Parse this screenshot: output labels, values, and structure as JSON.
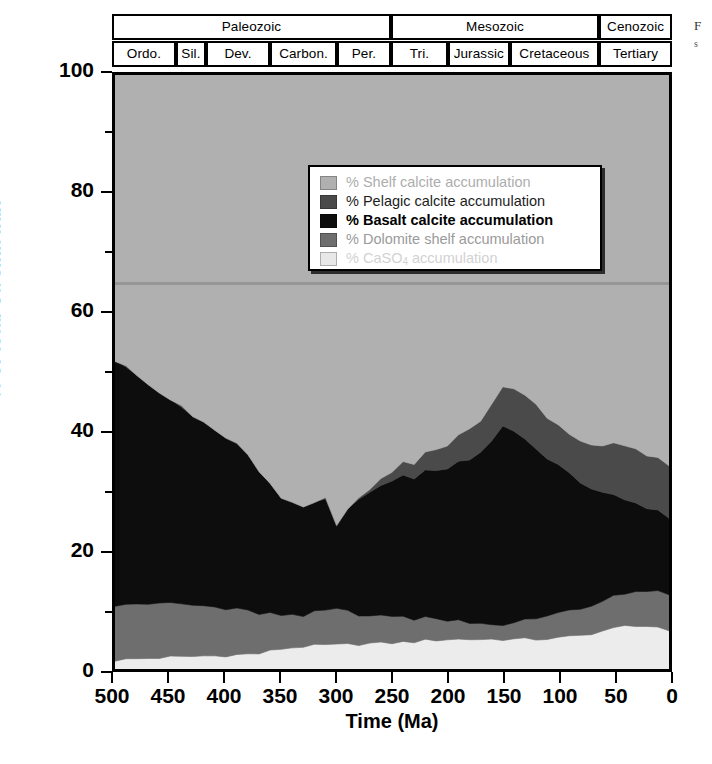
{
  "figure": {
    "xtitle": "Time (Ma)",
    "ytitle": "% of total Ca sink flux"
  },
  "caption_fragment": {
    "line1": "F",
    "line2": "s"
  },
  "timescale": {
    "eras": [
      {
        "label": "Paleozoic",
        "start": 500,
        "end": 251
      },
      {
        "label": "Mesozoic",
        "start": 251,
        "end": 65
      },
      {
        "label": "Cenozoic",
        "start": 65,
        "end": 0
      }
    ],
    "periods": [
      {
        "label": "Ordo.",
        "start": 500,
        "end": 443
      },
      {
        "label": "Sil.",
        "start": 443,
        "end": 416
      },
      {
        "label": "Dev.",
        "start": 416,
        "end": 359
      },
      {
        "label": "Carbon.",
        "start": 359,
        "end": 299
      },
      {
        "label": "Per.",
        "start": 299,
        "end": 251
      },
      {
        "label": "Tri.",
        "start": 251,
        "end": 200
      },
      {
        "label": "Jurassic",
        "start": 200,
        "end": 145
      },
      {
        "label": "Cretaceous",
        "start": 145,
        "end": 65
      },
      {
        "label": "Tertiary",
        "start": 65,
        "end": 0
      }
    ]
  },
  "legend": {
    "items": [
      {
        "label": "% Shelf calcite accumulation",
        "color": "#b0b0b0",
        "faded": "f1"
      },
      {
        "label": "% Pelagic calcite accumulation",
        "color": "#4a4a4a",
        "faded": "f2"
      },
      {
        "label": "% Basalt calcite accumulation",
        "color": "#0d0d0d",
        "faded": "f3"
      },
      {
        "label": "% Dolomite shelf accumulation",
        "color": "#6e6e6e",
        "faded": "f4"
      },
      {
        "label": "% CaSO₄ accumulation",
        "color": "#e8e8e8",
        "faded": "f5"
      }
    ]
  },
  "colors": {
    "shelf_calcite": "#b0b0b0",
    "pelagic_calcite": "#4a4a4a",
    "basalt_calcite": "#0d0d0d",
    "dolomite_shelf": "#6e6e6e",
    "caso4": "#ececec",
    "frame": "#000000",
    "plot_background": "#b0b0b0"
  },
  "chart_data": {
    "type": "area",
    "stacked": true,
    "title": "",
    "xlabel": "Time (Ma)",
    "ylabel": "% of total Ca sink flux",
    "xlim": [
      500,
      0
    ],
    "ylim": [
      0,
      100
    ],
    "x_reversed": true,
    "xticks": [
      500,
      450,
      400,
      350,
      300,
      250,
      200,
      150,
      100,
      50,
      0
    ],
    "yticks": [
      0,
      20,
      40,
      60,
      80,
      100
    ],
    "y_minor_ticks": [
      10,
      30,
      50,
      70,
      90
    ],
    "grid": false,
    "legend_position": "upper-center",
    "x": [
      500,
      490,
      480,
      470,
      460,
      450,
      440,
      430,
      420,
      410,
      400,
      390,
      380,
      370,
      360,
      350,
      340,
      330,
      320,
      310,
      300,
      290,
      280,
      270,
      260,
      250,
      240,
      230,
      220,
      210,
      200,
      190,
      180,
      170,
      160,
      150,
      140,
      130,
      120,
      110,
      100,
      90,
      80,
      70,
      60,
      50,
      40,
      30,
      20,
      10,
      0
    ],
    "series": [
      {
        "name": "% CaSO₄ accumulation",
        "color": "#ececec",
        "order": 1,
        "values": [
          1.5,
          1.6,
          1.7,
          1.8,
          1.9,
          2.0,
          2.0,
          2.1,
          2.2,
          2.2,
          2.3,
          2.4,
          2.5,
          2.6,
          3.0,
          3.4,
          3.6,
          3.8,
          3.9,
          4.0,
          4.0,
          4.1,
          4.2,
          4.3,
          4.3,
          4.4,
          4.5,
          4.6,
          4.8,
          4.9,
          5.0,
          5.0,
          5.0,
          5.0,
          5.0,
          5.0,
          5.0,
          5.0,
          5.0,
          5.1,
          5.2,
          5.4,
          5.6,
          6.0,
          6.4,
          6.8,
          7.2,
          7.4,
          7.2,
          6.8,
          6.2
        ]
      },
      {
        "name": "% Dolomite shelf accumulation",
        "color": "#6e6e6e",
        "order": 2,
        "values": [
          9.5,
          9.4,
          9.3,
          9.2,
          9.1,
          9.0,
          8.8,
          8.6,
          8.4,
          8.2,
          8.0,
          7.6,
          7.2,
          6.8,
          6.2,
          5.6,
          5.4,
          5.2,
          5.4,
          5.8,
          6.0,
          5.6,
          5.2,
          4.8,
          4.6,
          4.4,
          4.2,
          4.0,
          3.8,
          3.6,
          3.4,
          3.2,
          3.0,
          2.8,
          2.6,
          2.4,
          2.6,
          3.0,
          3.6,
          4.0,
          4.2,
          4.4,
          4.6,
          4.8,
          5.0,
          5.2,
          5.4,
          5.6,
          5.8,
          6.0,
          6.0
        ]
      },
      {
        "name": "% Basalt calcite accumulation",
        "color": "#0d0d0d",
        "order": 3,
        "values": [
          41.5,
          40.0,
          38.5,
          37.0,
          35.5,
          34.0,
          33.0,
          32.0,
          31.0,
          30.0,
          29.0,
          27.5,
          26.0,
          24.5,
          22.0,
          20.0,
          19.0,
          18.5,
          18.5,
          19.0,
          14.0,
          17.0,
          19.5,
          21.0,
          22.0,
          23.0,
          23.5,
          24.0,
          24.5,
          25.0,
          25.5,
          26.5,
          27.5,
          29.0,
          31.0,
          33.5,
          32.0,
          30.5,
          28.5,
          26.5,
          25.0,
          23.0,
          21.5,
          20.0,
          18.5,
          17.0,
          16.0,
          15.0,
          14.0,
          13.5,
          13.0
        ]
      },
      {
        "name": "% Pelagic calcite accumulation",
        "color": "#4a4a4a",
        "order": 4,
        "values": [
          0.0,
          0.0,
          0.0,
          0.0,
          0.0,
          0.0,
          0.0,
          0.0,
          0.0,
          0.0,
          0.0,
          0.0,
          0.0,
          0.0,
          0.0,
          0.0,
          0.0,
          0.0,
          0.0,
          0.0,
          0.0,
          0.0,
          0.0,
          0.5,
          1.0,
          1.5,
          2.0,
          2.5,
          3.0,
          3.5,
          4.0,
          4.5,
          5.0,
          5.5,
          6.0,
          6.5,
          7.0,
          7.5,
          7.5,
          7.0,
          6.5,
          6.5,
          7.0,
          7.5,
          8.0,
          8.5,
          9.0,
          9.0,
          9.0,
          9.0,
          9.0
        ]
      },
      {
        "name": "% Shelf calcite accumulation",
        "color": "#b0b0b0",
        "order": 5,
        "values": [
          47.5,
          49.0,
          50.5,
          52.0,
          53.5,
          55.0,
          56.2,
          57.3,
          58.4,
          59.6,
          60.7,
          62.5,
          64.3,
          66.1,
          68.8,
          71.0,
          72.0,
          72.5,
          72.2,
          71.2,
          76.0,
          73.3,
          71.1,
          69.4,
          68.1,
          66.7,
          65.8,
          64.9,
          63.9,
          63.0,
          62.1,
          60.8,
          59.5,
          57.7,
          55.4,
          52.6,
          53.4,
          54.0,
          55.4,
          57.4,
          59.1,
          60.7,
          61.3,
          61.7,
          62.1,
          62.5,
          62.4,
          63.0,
          64.0,
          64.7,
          65.8
        ]
      }
    ]
  }
}
